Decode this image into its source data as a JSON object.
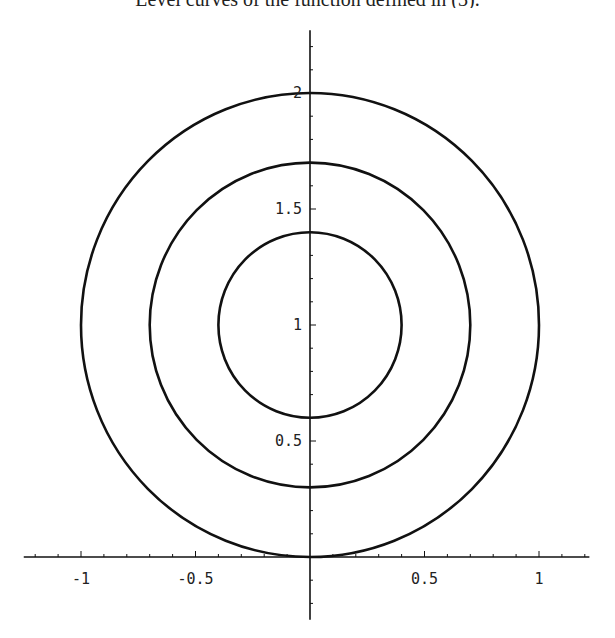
{
  "caption": {
    "text": "Level curves of the function defined in (3)."
  },
  "chart_data": {
    "type": "contour",
    "title": "",
    "xlabel": "",
    "ylabel": "",
    "xlim": [
      -1.25,
      1.22
    ],
    "ylim": [
      -0.27,
      2.27
    ],
    "grid": false,
    "legend": null,
    "axes_origin": [
      0,
      0
    ],
    "x_ticks": [
      -1,
      -0.5,
      0.5,
      1
    ],
    "x_tick_labels": [
      "-1",
      "-0.5",
      "0.5",
      "1"
    ],
    "y_ticks": [
      0.5,
      1,
      1.5,
      2
    ],
    "y_tick_labels": [
      "0.5",
      "1",
      "1.5",
      "2"
    ],
    "minor_tick_step": 0.1,
    "series": [
      {
        "name": "level-curve-inner",
        "shape": "circle",
        "center": [
          0,
          1
        ],
        "radius": 0.4
      },
      {
        "name": "level-curve-middle",
        "shape": "circle",
        "center": [
          0,
          1
        ],
        "radius": 0.7
      },
      {
        "name": "level-curve-outer",
        "shape": "circle",
        "center": [
          0,
          1
        ],
        "radius": 1.0
      }
    ],
    "line_color": "#111111"
  }
}
